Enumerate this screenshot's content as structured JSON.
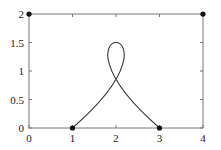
{
  "chart_data": {
    "type": "line",
    "title": "",
    "xlabel": "",
    "ylabel": "",
    "xlim": [
      0,
      4
    ],
    "ylim": [
      0,
      2
    ],
    "x_ticks": [
      "0",
      "1",
      "2",
      "3",
      "4"
    ],
    "y_ticks": [
      "0",
      "0.5",
      "1",
      "1.5",
      "2"
    ],
    "grid": false,
    "legend": null,
    "series": [
      {
        "name": "cubic Bezier curve",
        "kind": "bezier",
        "control_points": [
          [
            1,
            0
          ],
          [
            4,
            2
          ],
          [
            0,
            2
          ],
          [
            3,
            0
          ]
        ],
        "note": "self-intersecting loop, peak at (2, 1.5), crossing near (2, 0.9)"
      },
      {
        "name": "control points",
        "kind": "scatter",
        "points": [
          [
            0,
            2
          ],
          [
            4,
            2
          ],
          [
            1,
            0
          ],
          [
            3,
            0
          ]
        ]
      }
    ]
  },
  "axes": {
    "x_labels": [
      "0",
      "1",
      "2",
      "3",
      "4"
    ],
    "y_labels": [
      "0",
      "0.5",
      "1",
      "1.5",
      "2"
    ]
  },
  "colors": {
    "curve": "#333333",
    "points": "#111111",
    "frame": "#777777"
  }
}
